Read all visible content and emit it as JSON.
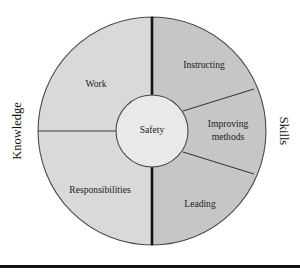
{
  "figure": {
    "center": {
      "label": "Safety"
    },
    "sides": {
      "left": {
        "label": "Knowledge"
      },
      "right": {
        "label": "Skills"
      }
    },
    "segments": [
      {
        "id": "work",
        "label": "Work",
        "half": "knowledge"
      },
      {
        "id": "responsibilities",
        "label": "Responsibilities",
        "half": "knowledge"
      },
      {
        "id": "instructing",
        "label": "Instructing",
        "half": "skills"
      },
      {
        "id": "improving-methods",
        "label_line1": "Improving",
        "label_line2": "methods",
        "half": "skills"
      },
      {
        "id": "leading",
        "label": "Leading",
        "half": "skills"
      }
    ],
    "colors": {
      "knowledge_fill": "#d9d9d9",
      "skills_fill": "#c6c6c6",
      "hub_fill": "#e4e4e4",
      "outline": "#4a4a4a",
      "divider": "#111111",
      "rule": "#111111",
      "background": "#ffffff"
    }
  }
}
